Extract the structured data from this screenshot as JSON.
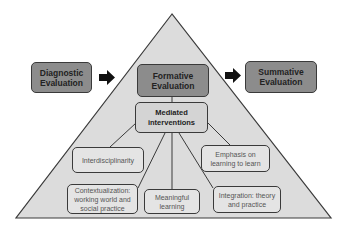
{
  "diagram": {
    "type": "pyramid-flow",
    "colors": {
      "triangle_fill": "#dcdcdc",
      "outline": "#3a3a3a",
      "stage_box": "#8c8c8c",
      "mediated_box": "#d4d4d4",
      "leaf_box": "#e4e4e4"
    },
    "stages": {
      "diagnostic": {
        "line1": "Diagnostic",
        "line2": "Evaluation"
      },
      "formative": {
        "line1": "Formative",
        "line2": "Evaluation"
      },
      "summative": {
        "line1": "Summative",
        "line2": "Evaluation"
      }
    },
    "mediated": {
      "line1": "Mediated",
      "line2": "interventions"
    },
    "components": [
      {
        "line1": "Interdisciplinarity",
        "line2": ""
      },
      {
        "line1": "Emphasis on",
        "line2": "learning to learn"
      },
      {
        "line1": "Contextualization:",
        "line2": "working world and",
        "line3": "social practice"
      },
      {
        "line1": "Meaningful",
        "line2": "learning"
      },
      {
        "line1": "Integration: theory",
        "line2": "and practice"
      }
    ],
    "arrows": [
      {
        "from": "Diagnostic Evaluation",
        "to": "Formative Evaluation"
      },
      {
        "from": "Formative Evaluation",
        "to": "Summative Evaluation"
      }
    ]
  }
}
